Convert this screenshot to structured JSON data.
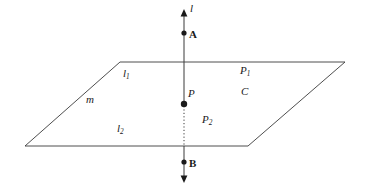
{
  "figure": {
    "type": "geometry-diagram",
    "background_color": "#ffffff",
    "stroke_color": "#3a3a3a",
    "text_color": "#1a1a1a",
    "canvas": {
      "width": 365,
      "height": 189
    },
    "plane": {
      "name": "plane-parallelogram",
      "corners": [
        {
          "x": 120,
          "y": 62
        },
        {
          "x": 345,
          "y": 62
        },
        {
          "x": 248,
          "y": 146
        },
        {
          "x": 25,
          "y": 146
        }
      ],
      "stroke_width": 0.9
    },
    "line_l": {
      "name": "line-l",
      "x": 184,
      "top_y": 10,
      "bottom_y": 182,
      "arrow_top_y": 10,
      "arrow_bottom_y": 182,
      "solid_segments": [
        {
          "from_y": 14,
          "to_y": 104
        },
        {
          "from_y": 146,
          "to_y": 178
        }
      ],
      "dotted_segment": {
        "from_y": 106,
        "to_y": 146
      },
      "stroke_width": 1.0
    },
    "points": [
      {
        "id": "A",
        "x": 184,
        "y": 33,
        "radius": 2.6
      },
      {
        "id": "P",
        "x": 184,
        "y": 104,
        "radius": 3.2
      },
      {
        "id": "B",
        "x": 184,
        "y": 162,
        "radius": 2.6
      }
    ],
    "labels": [
      {
        "id": "l",
        "text": "l",
        "sub": "",
        "x": 190,
        "y": 3,
        "style": "italic"
      },
      {
        "id": "A",
        "text": "A",
        "sub": "",
        "x": 189,
        "y": 29,
        "style": "upright-bold"
      },
      {
        "id": "l1",
        "text": "l",
        "sub": "1",
        "x": 123,
        "y": 68,
        "style": "italic"
      },
      {
        "id": "m",
        "text": "m",
        "sub": "",
        "x": 86,
        "y": 94,
        "style": "italic"
      },
      {
        "id": "l2",
        "text": "l",
        "sub": "2",
        "x": 117,
        "y": 123,
        "style": "italic"
      },
      {
        "id": "P",
        "text": "P",
        "sub": "",
        "x": 188,
        "y": 88,
        "style": "italic"
      },
      {
        "id": "P1",
        "text": "P",
        "sub": "1",
        "x": 240,
        "y": 65,
        "style": "italic"
      },
      {
        "id": "C",
        "text": "C",
        "sub": "",
        "x": 241,
        "y": 86,
        "style": "italic"
      },
      {
        "id": "P2",
        "text": "P",
        "sub": "2",
        "x": 202,
        "y": 114,
        "style": "italic"
      },
      {
        "id": "B",
        "text": "B",
        "sub": "",
        "x": 189,
        "y": 158,
        "style": "upright-bold"
      }
    ],
    "label_text": {
      "l": "l",
      "A": "A",
      "l1_base": "l",
      "l1_sub": "1",
      "m": "m",
      "l2_base": "l",
      "l2_sub": "2",
      "P": "P",
      "P1_base": "P",
      "P1_sub": "1",
      "C": "C",
      "P2_base": "P",
      "P2_sub": "2",
      "B": "B"
    }
  }
}
